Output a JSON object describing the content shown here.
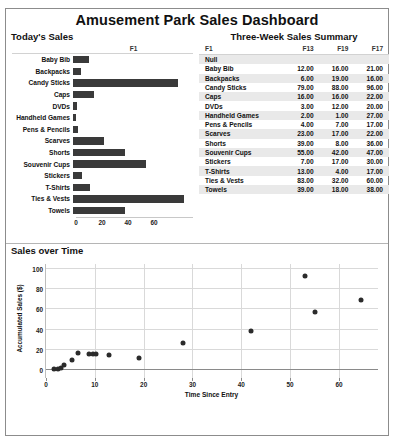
{
  "dashboard": {
    "title": "Amusement Park Sales Dashboard"
  },
  "left_panel": {
    "title": "Today's Sales",
    "series_header": "F1"
  },
  "right_panel": {
    "title": "Three-Week Sales Summary"
  },
  "bottom_panel": {
    "title": "Sales over Time"
  },
  "table": {
    "columns": [
      "F1",
      "F13",
      "F19",
      "F17"
    ],
    "rows": [
      {
        "name": "Null",
        "f13": "",
        "f19": "",
        "f17": ""
      },
      {
        "name": "Baby Bib",
        "f13": "12.00",
        "f19": "16.00",
        "f17": "21.00"
      },
      {
        "name": "Backpacks",
        "f13": "6.00",
        "f19": "19.00",
        "f17": "16.00"
      },
      {
        "name": "Candy Sticks",
        "f13": "79.00",
        "f19": "88.00",
        "f17": "96.00"
      },
      {
        "name": "Caps",
        "f13": "16.00",
        "f19": "16.00",
        "f17": "22.00"
      },
      {
        "name": "DVDs",
        "f13": "3.00",
        "f19": "12.00",
        "f17": "20.00"
      },
      {
        "name": "Handheld Games",
        "f13": "2.00",
        "f19": "1.00",
        "f17": "27.00"
      },
      {
        "name": "Pens & Pencils",
        "f13": "4.00",
        "f19": "7.00",
        "f17": "17.00"
      },
      {
        "name": "Scarves",
        "f13": "23.00",
        "f19": "17.00",
        "f17": "22.00"
      },
      {
        "name": "Shorts",
        "f13": "39.00",
        "f19": "8.00",
        "f17": "36.00"
      },
      {
        "name": "Souvenir Cups",
        "f13": "55.00",
        "f19": "42.00",
        "f17": "47.00"
      },
      {
        "name": "Stickers",
        "f13": "7.00",
        "f19": "17.00",
        "f17": "30.00"
      },
      {
        "name": "T-Shirts",
        "f13": "13.00",
        "f19": "4.00",
        "f17": "17.00"
      },
      {
        "name": "Ties & Vests",
        "f13": "83.00",
        "f19": "32.00",
        "f17": "60.00"
      },
      {
        "name": "Towels",
        "f13": "39.00",
        "f19": "18.00",
        "f17": "38.00"
      }
    ]
  },
  "chart_data": [
    {
      "type": "bar",
      "title": "Today's Sales",
      "orientation": "horizontal",
      "series_label": "F1",
      "categories": [
        "Baby Bib",
        "Backpacks",
        "Candy Sticks",
        "Caps",
        "DVDs",
        "Handheld Games",
        "Pens & Pencils",
        "Scarves",
        "Shorts",
        "Souvenir Cups",
        "Stickers",
        "T-Shirts",
        "Ties & Vests",
        "Towels"
      ],
      "values": [
        12,
        6,
        79,
        16,
        3,
        2,
        4,
        23,
        39,
        55,
        7,
        13,
        83,
        39
      ],
      "xlabel": "",
      "ylabel": "",
      "xlim": [
        0,
        90
      ],
      "xticks": [
        0,
        20,
        40,
        60
      ],
      "grid": false,
      "bar_color": "#3a3a3a"
    },
    {
      "type": "scatter",
      "title": "Sales over Time",
      "xlabel": "Time Since Entry",
      "ylabel": "Accumulated Sales ($)",
      "xlim": [
        0,
        68
      ],
      "ylim": [
        -8,
        105
      ],
      "xticks": [
        0,
        10,
        20,
        30,
        40,
        50,
        60
      ],
      "yticks": [
        0,
        20,
        40,
        60,
        80,
        100
      ],
      "grid": true,
      "point_color": "#2b2b2b",
      "points": [
        {
          "x": 1.6,
          "y": 1
        },
        {
          "x": 2.4,
          "y": 1
        },
        {
          "x": 3.0,
          "y": 2
        },
        {
          "x": 3.7,
          "y": 5
        },
        {
          "x": 5.4,
          "y": 10
        },
        {
          "x": 6.6,
          "y": 17
        },
        {
          "x": 8.8,
          "y": 16
        },
        {
          "x": 9.6,
          "y": 16
        },
        {
          "x": 10.2,
          "y": 16
        },
        {
          "x": 13.0,
          "y": 15
        },
        {
          "x": 19.0,
          "y": 12
        },
        {
          "x": 28.0,
          "y": 27
        },
        {
          "x": 42.0,
          "y": 39
        },
        {
          "x": 53.0,
          "y": 93
        },
        {
          "x": 55.0,
          "y": 57
        },
        {
          "x": 64.5,
          "y": 69
        }
      ]
    }
  ]
}
